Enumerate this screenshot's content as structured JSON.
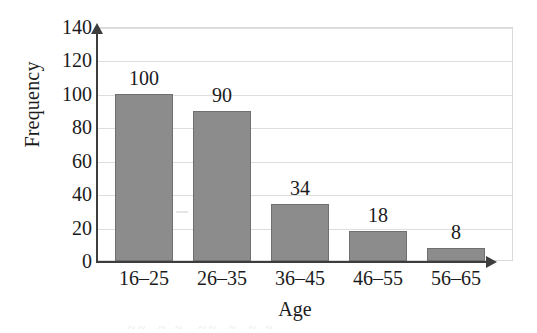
{
  "chart_data": {
    "type": "bar",
    "title": "",
    "subtitle": "",
    "xlabel": "Age",
    "ylabel": "Frequency",
    "categories": [
      "16–25",
      "26–35",
      "36–45",
      "46–55",
      "56–65"
    ],
    "values": [
      100,
      90,
      34,
      18,
      8
    ],
    "data_labels": [
      "100",
      "90",
      "34",
      "18",
      "8"
    ],
    "ylim": [
      0,
      140
    ],
    "ytick_values": [
      0,
      20,
      40,
      60,
      80,
      100,
      120,
      140
    ],
    "ytick_labels": [
      "0",
      "20",
      "40",
      "60",
      "80",
      "100",
      "120",
      "140"
    ],
    "ytick_step": 20,
    "grid": {
      "horizontal": true,
      "vertical": false,
      "color": "#dedede"
    },
    "legend": {
      "visible": false,
      "position": "none",
      "entries": []
    },
    "axes": {
      "y_arrow": true,
      "x_arrow": true,
      "axis_color": "#3d3d3d",
      "frame_color": "#d9d9d9"
    },
    "series": [
      {
        "name": "Frequency",
        "bar_color": "#8c8c8c",
        "bar_edge_color": "#6f6f6f",
        "values": [
          100,
          90,
          34,
          18,
          8
        ]
      }
    ]
  },
  "colors": {
    "background": "#ffffff",
    "text": "#1b1b1b",
    "bar_fill": "#8c8c8c",
    "bar_edge": "#6f6f6f",
    "gridline": "#dedede",
    "axis": "#3d3d3d",
    "frame": "#d9d9d9"
  }
}
